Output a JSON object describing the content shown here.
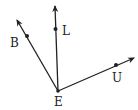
{
  "diagram": {
    "type": "geometry-rays",
    "vertex": {
      "label": "E",
      "x": 58,
      "y": 91,
      "label_x": 58,
      "label_y": 107
    },
    "rays": [
      {
        "name": "EB",
        "point_label": "B",
        "tip": [
          16,
          18
        ],
        "point": [
          27,
          36
        ],
        "label_pos": [
          14,
          47
        ]
      },
      {
        "name": "EL",
        "point_label": "L",
        "tip": [
          55,
          4
        ],
        "point": [
          55,
          29
        ],
        "label_pos": [
          66,
          35
        ]
      },
      {
        "name": "EU",
        "point_label": "U",
        "tip": [
          136,
          57
        ],
        "point": [
          116,
          65
        ],
        "label_pos": [
          118,
          82
        ]
      }
    ],
    "colors": {
      "stroke": "#222222",
      "background": "#ffffff"
    }
  },
  "labels": {
    "E": "E",
    "B": "B",
    "L": "L",
    "U": "U"
  }
}
